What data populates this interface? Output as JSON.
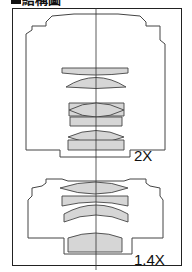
{
  "header": {
    "title": "結構圖"
  },
  "diagram": {
    "top_label": "2X",
    "bottom_label": "1.4X",
    "lens_fill": "#d8d8d8",
    "line_color": "#333333"
  }
}
